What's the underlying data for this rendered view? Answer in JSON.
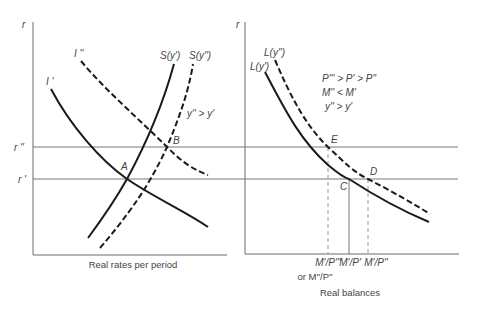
{
  "left_chart": {
    "y_axis_label": "r",
    "x_axis_label": "Real rates per period",
    "rate_labels": {
      "r_high": "r ''",
      "r_low": "r '"
    },
    "curves": {
      "investment_1": "I '",
      "investment_2": "I ''",
      "saving_1": "S(y')",
      "saving_2": "S(y'')"
    },
    "annotation": "y'' > y'",
    "points": {
      "a": "A",
      "b": "B"
    }
  },
  "right_chart": {
    "y_axis_label": "r",
    "x_axis_label": "Real balances",
    "curves": {
      "liquidity_1": "L(y')",
      "liquidity_2": "L(y'')"
    },
    "annotations": {
      "price_relation": "P''' > P' > P''",
      "money_relation": "M'' < M'",
      "income_relation": "y'' > y'"
    },
    "points": {
      "c": "C",
      "d": "D",
      "e": "E"
    },
    "x_ticks": {
      "tick_1": "M'/P'''",
      "tick_1_alt": "or M''/P''",
      "tick_2": "M'/P'",
      "tick_3": "M'/P''"
    }
  },
  "colors": {
    "curve": "#1a1a1a",
    "axis": "#6a6a6a",
    "text": "#444444"
  }
}
